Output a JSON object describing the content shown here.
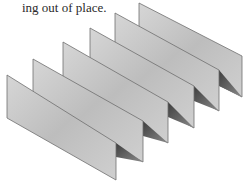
{
  "caption": {
    "text": "ing out of place."
  },
  "illustration": {
    "subject": "folded-panels-accordion-illustration",
    "panel_count": 6,
    "colors": {
      "panel_fill_light": "#d9d9d9",
      "panel_fill_dark": "#b3b3b3",
      "panel_edge": "#6e6e6e",
      "fold_shadow": "#5a5a5a",
      "background": "#ffffff",
      "text": "#2a2a2a"
    }
  }
}
